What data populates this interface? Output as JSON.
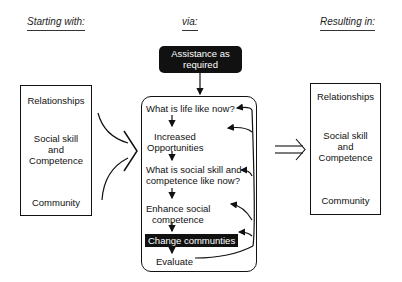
{
  "headers": {
    "starting": "Starting with:",
    "via": "via:",
    "resulting": "Resulting in:"
  },
  "assistance": {
    "line1": "Assistance as",
    "line2": "required"
  },
  "left_box": {
    "item1": "Relationships",
    "item2_line1": "Social skill",
    "item2_line2": "and",
    "item2_line3": "Competence",
    "item3": "Community"
  },
  "process": {
    "step1": "What is life like now?",
    "step2_line1": "Increased",
    "step2_line2": "Opportunities",
    "step3_line1": "What is social skill and",
    "step3_line2": "competence like now?",
    "step4_line1": "Enhance social",
    "step4_line2": "competence",
    "step5": "Change communties",
    "step6": "Evaluate"
  },
  "right_box": {
    "item1": "Relationships",
    "item2_line1": "Social skill",
    "item2_line2": "and",
    "item2_line3": "Competence",
    "item3": "Community"
  },
  "colors": {
    "ink": "#111111",
    "background": "#ffffff",
    "highlight_bg": "#111111",
    "highlight_text": "#ffffff"
  }
}
